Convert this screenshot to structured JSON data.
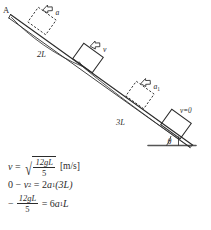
{
  "figure": {
    "ink_color": "#2b2b2b",
    "background_color": "#ffffff",
    "labels": {
      "point_a": "A",
      "distance_upper": "2L",
      "distance_lower": "3L",
      "accel_upper": "a",
      "velocity_mid": "v",
      "accel_lower": "a",
      "accel_lower_sub": "1",
      "final_velocity": "v=0",
      "angle": "θ"
    },
    "blocks": [
      {
        "name": "block-top-dashed",
        "style": "dashed",
        "label": "a"
      },
      {
        "name": "block-middle-solid",
        "style": "solid",
        "label": "v"
      },
      {
        "name": "block-lower-dashed",
        "style": "dashed",
        "label": "a1"
      },
      {
        "name": "block-bottom-solid",
        "style": "solid",
        "label": "v=0"
      }
    ]
  },
  "equations": {
    "line1": {
      "lhs": "v",
      "equals": "=",
      "radicand_numerator": "12gL",
      "radicand_denominator": "5",
      "unit": "[m/s]"
    },
    "line2": {
      "zero": "0",
      "minus": "−",
      "v": "v",
      "v_exponent": "2",
      "equals": "=",
      "two": "2",
      "a": "a",
      "a_sub": "1",
      "paren": "(3L)"
    },
    "line3": {
      "minus": "−",
      "numerator": "12gL",
      "denominator": "5",
      "equals": "=",
      "rhs_coeff": "6",
      "rhs_a": "a",
      "rhs_sub": "1",
      "rhs_L": "L"
    }
  }
}
